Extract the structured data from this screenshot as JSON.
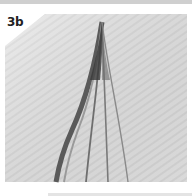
{
  "step": {
    "label": "3b"
  },
  "photo": {
    "subject": "folded paper strips forming a teardrop curve",
    "paper_color": "#e9e9e9",
    "shadow_color": "#555555"
  }
}
